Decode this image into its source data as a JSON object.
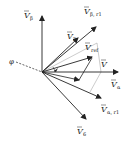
{
  "diagram": {
    "colors": {
      "stroke": "#222222",
      "guide": "#aaaaaa",
      "background": "#ffffff"
    },
    "labels": {
      "v_beta": {
        "main": "V",
        "sub": "β"
      },
      "v_beta_r1": {
        "main": "V",
        "sub": "β, r1"
      },
      "v2": {
        "main": "V",
        "sub": "2"
      },
      "v_ref": {
        "main": "V",
        "sub": "ref"
      },
      "v": {
        "main": "V",
        "sub": ""
      },
      "v_alpha": {
        "main": "V",
        "sub": "α"
      },
      "v_alpha_r1": {
        "main": "V",
        "sub": "α, r1"
      },
      "v6": {
        "main": "V",
        "sub": "6"
      },
      "phi": "φ"
    }
  }
}
